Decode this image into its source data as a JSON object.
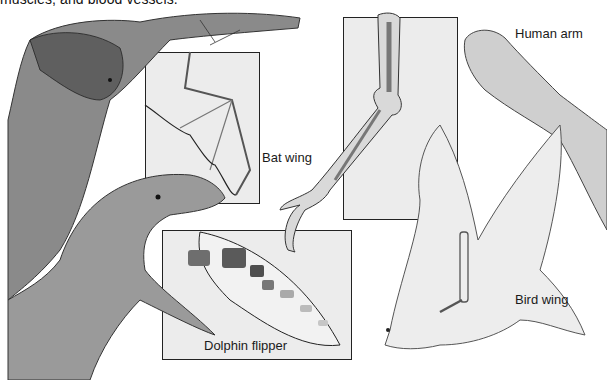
{
  "document": {
    "caption_fragment": "muscles, and blood vessels.",
    "labels": {
      "bat_wing": "Bat wing",
      "human_arm": "Human arm",
      "dolphin_flipper": "Dolphin flipper",
      "bird_wing": "Bird wing"
    }
  }
}
